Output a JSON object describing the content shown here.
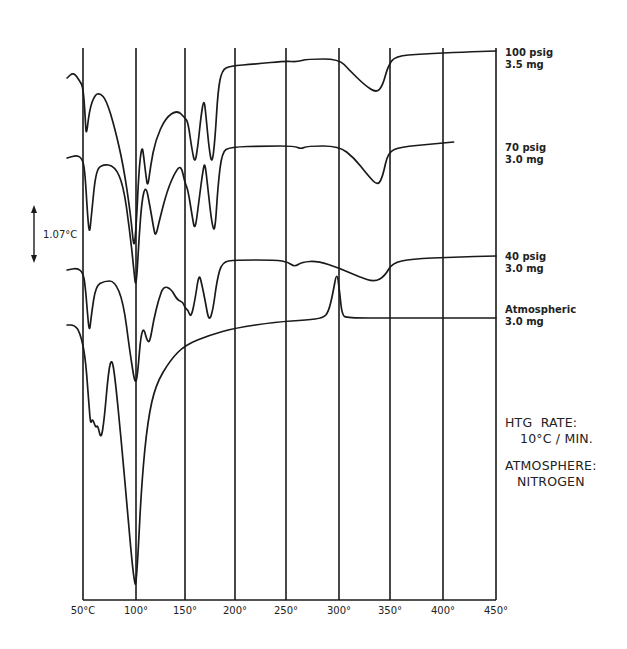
{
  "chart_data": {
    "type": "line",
    "title": "",
    "xlabel": "Temperature",
    "ylabel": "",
    "x_unit": "°C",
    "xlim": [
      50,
      450
    ],
    "x_ticks": [
      50,
      100,
      150,
      200,
      250,
      300,
      350,
      400,
      450
    ],
    "x_tick_labels": [
      "50°C",
      "100°",
      "150°",
      "200°",
      "250°",
      "300°",
      "350°",
      "400°",
      "450°"
    ],
    "grid": "vertical",
    "y_scale_bar": "1.07°C",
    "series": [
      {
        "name": "100 psig",
        "label_line1": "100 psig",
        "label_line2": "3.5 mg",
        "description": "DTA trace; endotherms near 53°, 98°, 108°, 163°, 178°; broad endotherm at ~340°",
        "points": [
          [
            35,
            78
          ],
          [
            41,
            72
          ],
          [
            47,
            81
          ],
          [
            50,
            87
          ],
          [
            52,
            115
          ],
          [
            53,
            138
          ],
          [
            56,
            110
          ],
          [
            61,
            95
          ],
          [
            66,
            93
          ],
          [
            72,
            100
          ],
          [
            80,
            128
          ],
          [
            88,
            165
          ],
          [
            95,
            215
          ],
          [
            98,
            250
          ],
          [
            100,
            230
          ],
          [
            103,
            170
          ],
          [
            106,
            145
          ],
          [
            108,
            157
          ],
          [
            110,
            175
          ],
          [
            112,
            188
          ],
          [
            115,
            165
          ],
          [
            120,
            140
          ],
          [
            130,
            118
          ],
          [
            142,
            110
          ],
          [
            150,
            118
          ],
          [
            153,
            122
          ],
          [
            157,
            150
          ],
          [
            160,
            164
          ],
          [
            163,
            145
          ],
          [
            166,
            116
          ],
          [
            169,
            98
          ],
          [
            171,
            116
          ],
          [
            174,
            148
          ],
          [
            177,
            165
          ],
          [
            180,
            140
          ],
          [
            183,
            90
          ],
          [
            187,
            70
          ],
          [
            195,
            66
          ],
          [
            220,
            64
          ],
          [
            250,
            61
          ],
          [
            260,
            62
          ],
          [
            270,
            59
          ],
          [
            300,
            59
          ],
          [
            310,
            70
          ],
          [
            325,
            85
          ],
          [
            337,
            93
          ],
          [
            343,
            85
          ],
          [
            348,
            66
          ],
          [
            355,
            56
          ],
          [
            380,
            54
          ],
          [
            420,
            52
          ],
          [
            450,
            51
          ]
        ]
      },
      {
        "name": "70 psig",
        "label_line1": "70 psig",
        "label_line2": "3.0 mg",
        "description": "DTA trace; endotherms near 55°, 99°, 110°, 163°, 178°; broad endotherm at ~340°",
        "points": [
          [
            35,
            158
          ],
          [
            45,
            155
          ],
          [
            50,
            160
          ],
          [
            52,
            175
          ],
          [
            54,
            210
          ],
          [
            56,
            236
          ],
          [
            58,
            215
          ],
          [
            62,
            172
          ],
          [
            68,
            164
          ],
          [
            80,
            166
          ],
          [
            88,
            185
          ],
          [
            94,
            230
          ],
          [
            98,
            270
          ],
          [
            100,
            290
          ],
          [
            103,
            240
          ],
          [
            106,
            200
          ],
          [
            110,
            185
          ],
          [
            114,
            205
          ],
          [
            118,
            228
          ],
          [
            120,
            237
          ],
          [
            124,
            220
          ],
          [
            132,
            190
          ],
          [
            140,
            172
          ],
          [
            146,
            165
          ],
          [
            150,
            183
          ],
          [
            153,
            190
          ],
          [
            157,
            215
          ],
          [
            160,
            232
          ],
          [
            164,
            200
          ],
          [
            168,
            170
          ],
          [
            170,
            162
          ],
          [
            173,
            190
          ],
          [
            177,
            225
          ],
          [
            180,
            232
          ],
          [
            183,
            185
          ],
          [
            187,
            152
          ],
          [
            195,
            147
          ],
          [
            230,
            146
          ],
          [
            258,
            146
          ],
          [
            264,
            149
          ],
          [
            270,
            146
          ],
          [
            300,
            146
          ],
          [
            315,
            158
          ],
          [
            328,
            175
          ],
          [
            338,
            186
          ],
          [
            343,
            176
          ],
          [
            348,
            152
          ],
          [
            360,
            147
          ],
          [
            390,
            144
          ],
          [
            410,
            142
          ]
        ]
      },
      {
        "name": "40 psig",
        "label_line1": "40 psig",
        "label_line2": "3.0 mg",
        "description": "DTA trace; endotherms near 55°, 100°, 112°, 155°, 175°; small dip ~258°, broad endotherm ~335°",
        "points": [
          [
            35,
            270
          ],
          [
            45,
            268
          ],
          [
            50,
            273
          ],
          [
            52,
            285
          ],
          [
            54,
            310
          ],
          [
            56,
            334
          ],
          [
            58,
            314
          ],
          [
            62,
            286
          ],
          [
            70,
            281
          ],
          [
            80,
            281
          ],
          [
            88,
            302
          ],
          [
            94,
            350
          ],
          [
            98,
            378
          ],
          [
            100,
            383
          ],
          [
            102,
            370
          ],
          [
            105,
            335
          ],
          [
            108,
            328
          ],
          [
            111,
            340
          ],
          [
            114,
            343
          ],
          [
            118,
            320
          ],
          [
            123,
            300
          ],
          [
            128,
            286
          ],
          [
            136,
            289
          ],
          [
            142,
            300
          ],
          [
            148,
            302
          ],
          [
            150,
            308
          ],
          [
            153,
            310
          ],
          [
            156,
            318
          ],
          [
            160,
            300
          ],
          [
            164,
            273
          ],
          [
            167,
            285
          ],
          [
            170,
            300
          ],
          [
            174,
            322
          ],
          [
            178,
            310
          ],
          [
            182,
            280
          ],
          [
            187,
            262
          ],
          [
            200,
            260
          ],
          [
            240,
            260
          ],
          [
            252,
            262
          ],
          [
            258,
            267
          ],
          [
            265,
            262
          ],
          [
            280,
            261
          ],
          [
            300,
            268
          ],
          [
            320,
            277
          ],
          [
            335,
            282
          ],
          [
            345,
            276
          ],
          [
            352,
            263
          ],
          [
            370,
            259
          ],
          [
            410,
            257
          ],
          [
            450,
            256
          ]
        ]
      },
      {
        "name": "Atmospheric",
        "label_line1": "Atmospheric",
        "label_line2": "3.0 mg",
        "description": "DTA trace; endotherms near 55°, 67°, large endotherm ~100°; sharp exotherm spike ~298°",
        "points": [
          [
            35,
            325
          ],
          [
            42,
            325
          ],
          [
            47,
            332
          ],
          [
            52,
            355
          ],
          [
            55,
            395
          ],
          [
            57,
            425
          ],
          [
            59,
            418
          ],
          [
            62,
            428
          ],
          [
            64,
            425
          ],
          [
            67,
            440
          ],
          [
            70,
            420
          ],
          [
            74,
            372
          ],
          [
            77,
            358
          ],
          [
            80,
            375
          ],
          [
            86,
            440
          ],
          [
            92,
            510
          ],
          [
            96,
            560
          ],
          [
            99,
            585
          ],
          [
            100,
            583
          ],
          [
            102,
            555
          ],
          [
            106,
            480
          ],
          [
            112,
            420
          ],
          [
            120,
            385
          ],
          [
            135,
            360
          ],
          [
            150,
            345
          ],
          [
            175,
            335
          ],
          [
            200,
            328
          ],
          [
            240,
            322
          ],
          [
            270,
            320
          ],
          [
            285,
            318
          ],
          [
            290,
            312
          ],
          [
            294,
            295
          ],
          [
            298,
            270
          ],
          [
            301,
            295
          ],
          [
            303,
            315
          ],
          [
            308,
            318
          ],
          [
            350,
            318
          ],
          [
            400,
            318
          ],
          [
            450,
            318
          ]
        ]
      }
    ],
    "annotations": [
      {
        "line1": "HTG  RATE:",
        "line2": "10°C / MIN."
      },
      {
        "line1": "ATMOSPHERE:",
        "line2": "NITROGEN"
      }
    ]
  },
  "labels": {
    "x_ticks": [
      "50°C",
      "100°",
      "150°",
      "200°",
      "250°",
      "300°",
      "350°",
      "400°",
      "450°"
    ],
    "scale_bar": "1.07°C",
    "legend": [
      {
        "line1": "100 psig",
        "line2": "3.5 mg"
      },
      {
        "line1": "70 psig",
        "line2": "3.0 mg"
      },
      {
        "line1": "40 psig",
        "line2": "3.0 mg"
      },
      {
        "line1": "Atmospheric",
        "line2": "3.0 mg"
      }
    ],
    "htg_rate_title": "HTG  RATE:",
    "htg_rate_value": "10°C / MIN.",
    "atmosphere_title": "ATMOSPHERE:",
    "atmosphere_value": "NITROGEN"
  }
}
